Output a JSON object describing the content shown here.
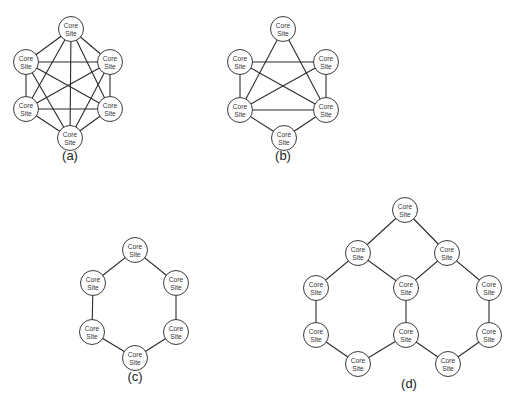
{
  "figure": {
    "node_label_line1": "Core",
    "node_label_line2": "Site",
    "node_radius": 12.5,
    "diagrams": [
      {
        "id": "a",
        "caption": "(a)",
        "caption_pos": [
          70,
          160
        ],
        "description": "Fully meshed: six core sites, every site linked to every other",
        "nodes": [
          {
            "id": "top",
            "x": 71,
            "y": 29
          },
          {
            "id": "upper-left",
            "x": 26,
            "y": 62
          },
          {
            "id": "upper-right",
            "x": 110,
            "y": 62
          },
          {
            "id": "lower-left",
            "x": 26,
            "y": 109
          },
          {
            "id": "lower-right",
            "x": 110,
            "y": 109
          },
          {
            "id": "bottom",
            "x": 70,
            "y": 138
          }
        ],
        "edges": [
          [
            0,
            1
          ],
          [
            0,
            2
          ],
          [
            0,
            3
          ],
          [
            0,
            4
          ],
          [
            0,
            5
          ],
          [
            1,
            2
          ],
          [
            1,
            3
          ],
          [
            1,
            4
          ],
          [
            1,
            5
          ],
          [
            2,
            3
          ],
          [
            2,
            4
          ],
          [
            2,
            5
          ],
          [
            3,
            4
          ],
          [
            3,
            5
          ],
          [
            4,
            5
          ]
        ]
      },
      {
        "id": "b",
        "caption": "(b)",
        "caption_pos": [
          283,
          160
        ],
        "description": "Partially meshed: six core sites",
        "nodes": [
          {
            "id": "top",
            "x": 283,
            "y": 29
          },
          {
            "id": "upper-left",
            "x": 240,
            "y": 62
          },
          {
            "id": "upper-right",
            "x": 326,
            "y": 62
          },
          {
            "id": "lower-left",
            "x": 240,
            "y": 110
          },
          {
            "id": "lower-right",
            "x": 326,
            "y": 110
          },
          {
            "id": "bottom",
            "x": 284,
            "y": 138
          }
        ],
        "edges": [
          [
            0,
            3
          ],
          [
            0,
            4
          ],
          [
            1,
            2
          ],
          [
            1,
            3
          ],
          [
            1,
            4
          ],
          [
            2,
            3
          ],
          [
            2,
            4
          ],
          [
            3,
            4
          ],
          [
            3,
            5
          ],
          [
            4,
            5
          ]
        ]
      },
      {
        "id": "c",
        "caption": "(c)",
        "caption_pos": [
          135,
          381
        ],
        "description": "Ring: six core sites",
        "nodes": [
          {
            "id": "top",
            "x": 135,
            "y": 250
          },
          {
            "id": "upper-left",
            "x": 93,
            "y": 283
          },
          {
            "id": "upper-right",
            "x": 176,
            "y": 283
          },
          {
            "id": "lower-left",
            "x": 92,
            "y": 332
          },
          {
            "id": "lower-right",
            "x": 176,
            "y": 332
          },
          {
            "id": "bottom",
            "x": 135,
            "y": 358
          }
        ],
        "edges": [
          [
            0,
            1
          ],
          [
            0,
            2
          ],
          [
            1,
            3
          ],
          [
            2,
            4
          ],
          [
            3,
            5
          ],
          [
            4,
            5
          ]
        ]
      },
      {
        "id": "d",
        "caption": "(d)",
        "caption_pos": [
          409,
          388
        ],
        "description": "Multiple interconnected rings: eleven core sites",
        "nodes": [
          {
            "id": "top",
            "x": 405,
            "y": 210
          },
          {
            "id": "upper-left",
            "x": 358,
            "y": 253
          },
          {
            "id": "upper-right",
            "x": 447,
            "y": 253
          },
          {
            "id": "left-mid",
            "x": 316,
            "y": 288
          },
          {
            "id": "center",
            "x": 406,
            "y": 288
          },
          {
            "id": "right-mid",
            "x": 489,
            "y": 288
          },
          {
            "id": "left-lower",
            "x": 316,
            "y": 335
          },
          {
            "id": "center-lower",
            "x": 406,
            "y": 335
          },
          {
            "id": "right-lower",
            "x": 489,
            "y": 335
          },
          {
            "id": "bottom-left",
            "x": 358,
            "y": 364
          },
          {
            "id": "bottom-right",
            "x": 448,
            "y": 364
          }
        ],
        "edges": [
          [
            0,
            1
          ],
          [
            0,
            2
          ],
          [
            1,
            3
          ],
          [
            1,
            4
          ],
          [
            2,
            4
          ],
          [
            2,
            5
          ],
          [
            3,
            6
          ],
          [
            4,
            7
          ],
          [
            5,
            8
          ],
          [
            6,
            9
          ],
          [
            7,
            9
          ],
          [
            7,
            10
          ],
          [
            8,
            10
          ]
        ]
      }
    ]
  }
}
